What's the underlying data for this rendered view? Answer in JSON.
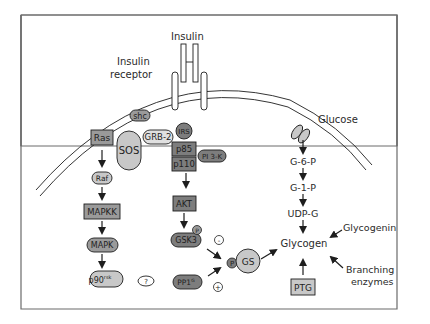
{
  "diagram": {
    "colors": {
      "frame": "#6b6b6b",
      "light_node": "#c8c8c8",
      "mid_node": "#9a9a9a",
      "dark_node": "#7d7d7d",
      "stroke": "#1e1e1e",
      "text": "#2a2a2a"
    },
    "labels": {
      "insulin": "Insulin",
      "insulin_receptor_1": "Insulin",
      "insulin_receptor_2": "receptor",
      "glucose": "Glucose",
      "glycogenin": "Glycogenin",
      "branching_1": "Branching",
      "branching_2": "enzymes"
    },
    "nodes": {
      "shc": "shc",
      "ras": "Ras",
      "sos": "SOS",
      "grb2": "GRB-2",
      "irs": "IRS",
      "p85": "p85",
      "pi3k": "PI 3-K",
      "p110": "p110",
      "raf": "Raf",
      "mapkk": "MAPKK",
      "mapk": "MAPK",
      "p90": "p90",
      "p90_sup": "rsk",
      "unknown": "?",
      "akt": "AKT",
      "gsk3": "GSK3",
      "p_gsk3": "P",
      "pp1": "PP1",
      "pp1_sup": "G",
      "minus": "-",
      "plus": "+",
      "p_gs": "P",
      "gs": "GS",
      "g6p": "G-6-P",
      "g1p": "G-1-P",
      "udpg": "UDP-G",
      "glycogen": "Glycogen",
      "ptg": "PTG"
    }
  }
}
